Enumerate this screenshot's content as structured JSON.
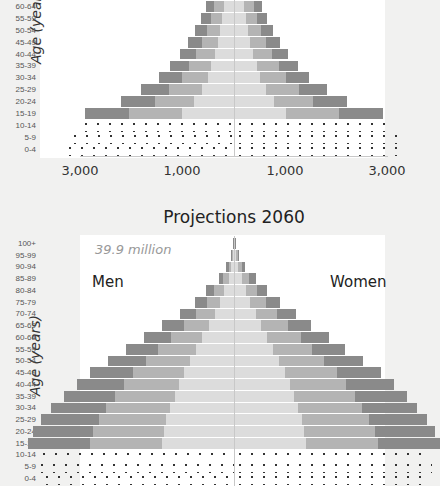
{
  "chart_data": [
    {
      "type": "bar",
      "subtype": "population-pyramid",
      "title": "",
      "ylabel": "Age (years)",
      "xlabel": "",
      "x_tick_labels": [
        "3,000",
        "1,000",
        "1,000",
        "3,000"
      ],
      "categories": [
        "60-64",
        "55-59",
        "50-54",
        "45-49",
        "40-44",
        "35-39",
        "30-34",
        "25-29",
        "20-24",
        "15-19",
        "10-14",
        "5-9",
        "0-4"
      ],
      "series": [
        {
          "name": "Men",
          "values": [
            550,
            650,
            750,
            900,
            1050,
            1250,
            1450,
            1800,
            2200,
            2900,
            3000,
            3200,
            3300
          ]
        },
        {
          "name": "Women",
          "values": [
            550,
            650,
            750,
            900,
            1050,
            1250,
            1450,
            1800,
            2200,
            2900,
            3000,
            3200,
            3300
          ]
        }
      ],
      "hatched_categories": [
        "10-14",
        "5-9",
        "0-4"
      ],
      "xlim": [
        -3000,
        3000
      ]
    },
    {
      "type": "bar",
      "subtype": "population-pyramid",
      "title": "Projections 2060",
      "annotation": "39.9 million",
      "ylabel": "Age (years)",
      "xlabel": "",
      "legend": [
        "Men",
        "Women"
      ],
      "categories": [
        "100+",
        "95-99",
        "90-94",
        "85-89",
        "80-84",
        "75-79",
        "70-74",
        "65-69",
        "60-64",
        "55-59",
        "50-54",
        "45-49",
        "40-44",
        "35-39",
        "30-34",
        "25-29",
        "20-24",
        "15-19",
        "10-14",
        "5-9",
        "0-4"
      ],
      "series": [
        {
          "name": "Men",
          "values": [
            20,
            60,
            150,
            300,
            550,
            750,
            1050,
            1400,
            1750,
            2100,
            2450,
            2800,
            3050,
            3300,
            3550,
            3750,
            3900,
            4000,
            3800,
            3850,
            3750
          ]
        },
        {
          "name": "Women",
          "values": [
            40,
            100,
            220,
            420,
            650,
            900,
            1200,
            1500,
            1850,
            2150,
            2500,
            2850,
            3100,
            3350,
            3550,
            3750,
            3900,
            4000,
            3800,
            3850,
            3750
          ]
        }
      ],
      "hatched_categories": [
        "10-14",
        "5-9",
        "0-4"
      ],
      "xlim": [
        -3000,
        3000
      ]
    }
  ],
  "top": {
    "ylabel": "Age (years",
    "ages": [
      "60-64",
      "55-59",
      "50-54",
      "45-49",
      "40-44",
      "35-39",
      "30-34",
      "25-29",
      "20-24",
      "15-19",
      "10-14",
      "5-9",
      "0-4"
    ],
    "ticks": [
      "3,000",
      "1,000",
      "1,000",
      "3,000"
    ]
  },
  "bottom": {
    "title": "Projections 2060",
    "total": "39.9 million",
    "men_label": "Men",
    "women_label": "Women",
    "ylabel": "Age (years)",
    "ages": [
      "100+",
      "95-99",
      "90-94",
      "85-89",
      "80-84",
      "75-79",
      "70-74",
      "65-69",
      "60-64",
      "55-59",
      "50-54",
      "45-49",
      "40-44",
      "35-39",
      "30-34",
      "25-29",
      "20-24",
      "15-19",
      "10-14",
      "5-9",
      "0-4"
    ]
  },
  "colors": {
    "dark": "#8a8a8a",
    "mid": "#b4b4b4",
    "light": "#dcdcdc",
    "axis": "#c8c8c8"
  }
}
